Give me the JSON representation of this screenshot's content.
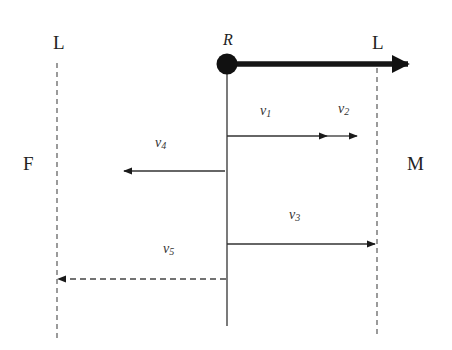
{
  "labels": {
    "left_line": "L",
    "right_line": "L",
    "left_region": "F",
    "right_region": "M",
    "origin": "R"
  },
  "vectors": [
    {
      "id": "v1",
      "base": "v",
      "sub": "1",
      "direction": "right",
      "style": "solid"
    },
    {
      "id": "v2",
      "base": "v",
      "sub": "2",
      "direction": "right",
      "style": "solid"
    },
    {
      "id": "v3",
      "base": "v",
      "sub": "3",
      "direction": "right",
      "style": "solid"
    },
    {
      "id": "v4",
      "base": "v",
      "sub": "4",
      "direction": "left",
      "style": "solid"
    },
    {
      "id": "v5",
      "base": "v",
      "sub": "5",
      "direction": "left",
      "style": "dashed"
    }
  ],
  "colors": {
    "stroke": "#222222",
    "dashed": "#555555",
    "background": "#ffffff"
  }
}
